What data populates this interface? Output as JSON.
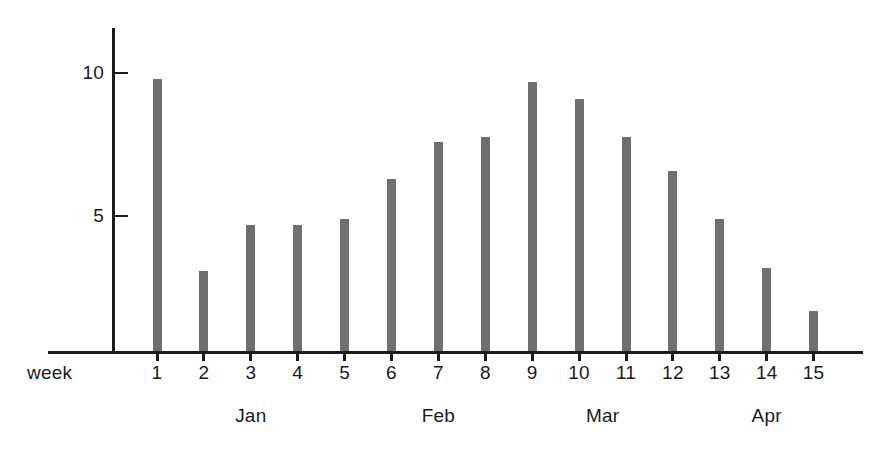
{
  "chart_data": {
    "type": "bar",
    "title": "",
    "subtitle": "",
    "xlabel": "week",
    "ylabel": "",
    "categories": [
      "1",
      "2",
      "3",
      "4",
      "5",
      "6",
      "7",
      "8",
      "9",
      "10",
      "11",
      "12",
      "13",
      "14",
      "15"
    ],
    "values": [
      9.5,
      2.8,
      4.4,
      4.4,
      4.6,
      6.0,
      7.3,
      7.5,
      9.4,
      8.8,
      7.5,
      6.3,
      4.6,
      2.9,
      1.4
    ],
    "series": [
      {
        "name": "",
        "values": [
          9.5,
          2.8,
          4.4,
          4.4,
          4.6,
          6.0,
          7.3,
          7.5,
          9.4,
          8.8,
          7.5,
          6.3,
          4.6,
          2.9,
          1.4
        ]
      }
    ],
    "ylim": [
      0,
      11.4
    ],
    "y_ticks": [
      5,
      10
    ],
    "y_tick_labels": [
      "5",
      "10"
    ],
    "grid": false,
    "legend": false,
    "legend_position": "none",
    "bar_color": "#6f6f6f",
    "axis_color": "#1c1c1c",
    "background_color": "#ffffff",
    "group_labels": [
      {
        "text": "Jan",
        "weeks": [
          "1",
          "2",
          "3",
          "4",
          "5"
        ],
        "center_week": "3"
      },
      {
        "text": "Feb",
        "weeks": [
          "6",
          "7",
          "8"
        ],
        "center_week": "7"
      },
      {
        "text": "Mar",
        "weeks": [
          "9",
          "10",
          "11",
          "12"
        ],
        "center_week": "10.5"
      },
      {
        "text": "Apr",
        "weeks": [
          "13",
          "14",
          "15"
        ],
        "center_week": "14"
      }
    ]
  },
  "axis": {
    "y_label_10": "10",
    "y_label_5": "5",
    "x_caption": "week"
  },
  "x_tick_labels": [
    "1",
    "2",
    "3",
    "4",
    "5",
    "6",
    "7",
    "8",
    "9",
    "10",
    "11",
    "12",
    "13",
    "14",
    "15"
  ],
  "months": [
    "Jan",
    "Feb",
    "Mar",
    "Apr"
  ]
}
